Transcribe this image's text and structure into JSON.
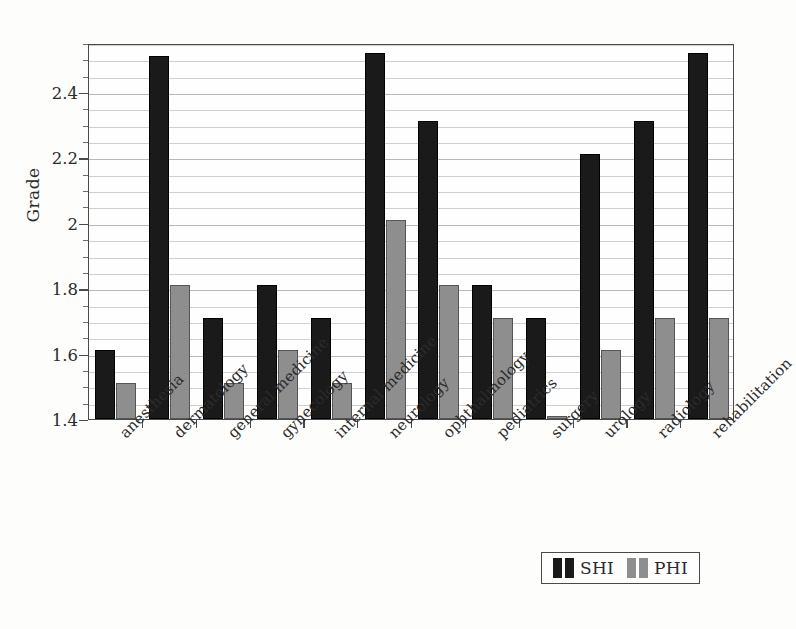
{
  "chart_data": {
    "type": "bar",
    "title": "",
    "xlabel": "",
    "ylabel": "Grade",
    "ylim": [
      1.4,
      2.55
    ],
    "yticks": [
      1.4,
      1.6,
      1.8,
      2.0,
      2.2,
      2.4
    ],
    "ytick_labels": [
      "1.4",
      "1.6",
      "1.8",
      "2",
      "2.2",
      "2.4"
    ],
    "minor_tick_step": 0.05,
    "grid": true,
    "grid_axis": "y",
    "legend_position": "bottom-right",
    "categories": [
      "anesthesia",
      "dermatology",
      "general medicine",
      "gynecology",
      "internal medicine",
      "neurology",
      "ophthalmology",
      "pediatrics",
      "surgery",
      "urology",
      "radiology",
      "rehabilitation"
    ],
    "series": [
      {
        "name": "SHI",
        "color": "#1a1a1a",
        "values": [
          1.61,
          2.51,
          1.71,
          1.81,
          1.71,
          2.52,
          2.31,
          1.81,
          1.71,
          2.21,
          2.31,
          2.52
        ]
      },
      {
        "name": "PHI",
        "color": "#8e8e8e",
        "values": [
          1.51,
          1.81,
          1.51,
          1.61,
          1.51,
          2.01,
          1.81,
          1.71,
          1.41,
          1.61,
          1.71,
          1.71
        ]
      }
    ]
  },
  "legend": {
    "entries": [
      {
        "label": "SHI",
        "key": "shi"
      },
      {
        "label": "PHI",
        "key": "phi"
      }
    ]
  },
  "axes": {
    "y_title": "Grade"
  }
}
